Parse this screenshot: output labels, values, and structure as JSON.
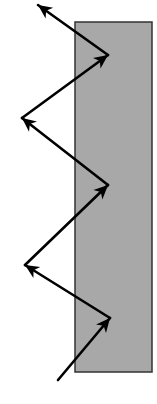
{
  "diagram": {
    "title": "",
    "canvas": {
      "width": 157,
      "height": 404,
      "background": "#ffffff"
    },
    "slab": {
      "x": 75,
      "y": 22,
      "width": 77,
      "height": 350,
      "fill": "#a8a8a8",
      "stroke": "#333333",
      "stroke_width": 1.5
    },
    "arrow_color": "#000000",
    "arrow_width": 2.6,
    "path_points": [
      [
        58,
        380
      ],
      [
        110,
        318
      ],
      [
        25,
        265
      ],
      [
        108,
        185
      ],
      [
        22,
        118
      ],
      [
        108,
        55
      ],
      [
        38,
        5
      ]
    ],
    "segments": [
      {
        "from": [
          58,
          380
        ],
        "to": [
          110,
          318
        ],
        "head": "end"
      },
      {
        "from": [
          110,
          318
        ],
        "to": [
          25,
          265
        ],
        "head": "end"
      },
      {
        "from": [
          25,
          265
        ],
        "to": [
          108,
          185
        ],
        "head": "end"
      },
      {
        "from": [
          108,
          185
        ],
        "to": [
          22,
          118
        ],
        "head": "end"
      },
      {
        "from": [
          22,
          118
        ],
        "to": [
          108,
          55
        ],
        "head": "end"
      },
      {
        "from": [
          108,
          55
        ],
        "to": [
          38,
          5
        ],
        "head": "end"
      }
    ]
  }
}
